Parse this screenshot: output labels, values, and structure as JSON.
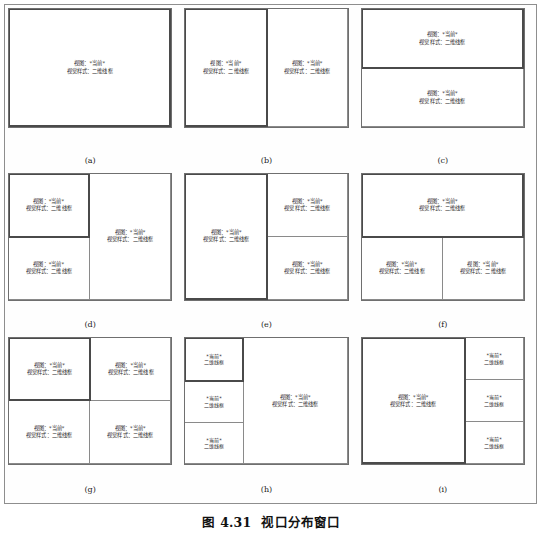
{
  "figure": {
    "caption_number": "图 4.31",
    "caption_title": "视口分布窗口"
  },
  "viewport_label": {
    "line1": "视图：*当前*",
    "line2": "视觉样式：二维线框",
    "short_line1": "*当前*",
    "short_line2": "二维线框"
  },
  "panels": [
    {
      "tag": "(a)",
      "name": "single-viewport",
      "viewports": [
        {
          "active": true,
          "size": "full",
          "l1": "视图：*当前*",
          "l2": "视觉样式：二维线框"
        }
      ]
    },
    {
      "tag": "(b)",
      "name": "two-vertical-viewports",
      "viewports": [
        {
          "active": true,
          "size": "full",
          "l1": "视图：*当前*",
          "l2": "视觉样式：二维线框"
        },
        {
          "active": false,
          "size": "full",
          "l1": "视图：*当前*",
          "l2": "视觉样式：二维线框"
        }
      ]
    },
    {
      "tag": "(c)",
      "name": "two-horizontal-viewports",
      "viewports": [
        {
          "active": true,
          "size": "full",
          "l1": "视图：*当前*",
          "l2": "视觉样式：二维线框"
        },
        {
          "active": false,
          "size": "full",
          "l1": "视图：*当前*",
          "l2": "视觉样式：二维线框"
        }
      ]
    },
    {
      "tag": "(d)",
      "name": "two-left-one-right",
      "viewports": [
        {
          "active": true,
          "size": "full",
          "l1": "视图：*当前*",
          "l2": "视觉样式：二维线框"
        },
        {
          "active": false,
          "size": "full",
          "l1": "视图：*当前*",
          "l2": "视觉样式：二维线框"
        },
        {
          "active": false,
          "size": "full",
          "l1": "视图：*当前*",
          "l2": "视觉样式：二维线框"
        }
      ]
    },
    {
      "tag": "(e)",
      "name": "one-left-two-right",
      "viewports": [
        {
          "active": true,
          "size": "full",
          "l1": "视图：*当前*",
          "l2": "视觉样式：二维线框"
        },
        {
          "active": false,
          "size": "full",
          "l1": "视图：*当前*",
          "l2": "视觉样式：二维线框"
        },
        {
          "active": false,
          "size": "full",
          "l1": "视图：*当前*",
          "l2": "视觉样式：二维线框"
        }
      ]
    },
    {
      "tag": "(f)",
      "name": "one-top-two-bottom",
      "viewports": [
        {
          "active": true,
          "size": "full",
          "l1": "视图：*当前*",
          "l2": "视觉样式：二维线框"
        },
        {
          "active": false,
          "size": "full",
          "l1": "视图：*当前*",
          "l2": "视觉样式：二维线框"
        },
        {
          "active": false,
          "size": "full",
          "l1": "视图：*当前*",
          "l2": "视觉样式：二维线框"
        }
      ]
    },
    {
      "tag": "(g)",
      "name": "four-quadrant-viewports",
      "viewports": [
        {
          "active": true,
          "size": "full",
          "l1": "视图：*当前*",
          "l2": "视觉样式：二维线框"
        },
        {
          "active": false,
          "size": "full",
          "l1": "视图：*当前*",
          "l2": "视觉样式：二维线框"
        },
        {
          "active": false,
          "size": "full",
          "l1": "视图：*当前*",
          "l2": "视觉样式：二维线框"
        },
        {
          "active": false,
          "size": "full",
          "l1": "视图：*当前*",
          "l2": "视觉样式：二维线框"
        }
      ]
    },
    {
      "tag": "(h)",
      "name": "three-left-one-big-right",
      "viewports": [
        {
          "active": true,
          "size": "small",
          "l1": "*当前*",
          "l2": "二维线框"
        },
        {
          "active": false,
          "size": "small",
          "l1": "*当前*",
          "l2": "二维线框"
        },
        {
          "active": false,
          "size": "small",
          "l1": "*当前*",
          "l2": "二维线框"
        },
        {
          "active": false,
          "size": "full",
          "l1": "视图：*当前*",
          "l2": "视觉样式：二维线框"
        }
      ]
    },
    {
      "tag": "(i)",
      "name": "one-big-left-three-right",
      "viewports": [
        {
          "active": true,
          "size": "full",
          "l1": "视图：*当前*",
          "l2": "视觉样式：二维线框"
        },
        {
          "active": false,
          "size": "small",
          "l1": "*当前*",
          "l2": "二维线框"
        },
        {
          "active": false,
          "size": "small",
          "l1": "*当前*",
          "l2": "二维线框"
        },
        {
          "active": false,
          "size": "small",
          "l1": "*当前*",
          "l2": "二维线框"
        }
      ]
    }
  ]
}
